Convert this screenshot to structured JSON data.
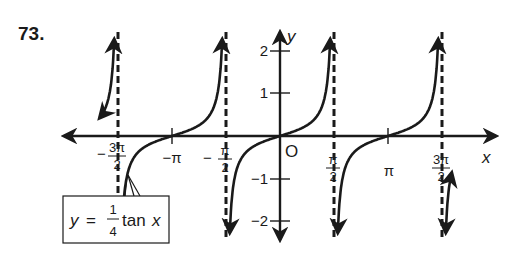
{
  "problem_number": "73.",
  "colors": {
    "ink": "#1a1a1a",
    "background": "#ffffff"
  },
  "axes": {
    "x_label": "x",
    "y_label": "y",
    "origin_label": "O",
    "x_ticks": [
      {
        "sign": "−",
        "num": "3π",
        "den": "2",
        "value": -4.712
      },
      {
        "label": "−π",
        "value": -3.1416
      },
      {
        "sign": "−",
        "num": "π",
        "den": "2",
        "value": -1.5708
      },
      {
        "num": "π",
        "den": "2",
        "value": 1.5708
      },
      {
        "label": "π",
        "value": 3.1416
      },
      {
        "num": "3π",
        "den": "2",
        "value": 4.712
      }
    ],
    "y_ticks": [
      "2",
      "1",
      "−1",
      "−2"
    ]
  },
  "equation": {
    "lhs": "y",
    "equals": "=",
    "coef_num": "1",
    "coef_den": "4",
    "func": "tan",
    "var": "x"
  },
  "chart_data": {
    "type": "line",
    "title": "",
    "function": "y = (1/4) tan x",
    "xlabel": "x",
    "ylabel": "y",
    "xlim": [
      -5.5,
      7.6
    ],
    "ylim": [
      -2.3,
      2.3
    ],
    "grid": false,
    "asymptotes": [
      "-3π/2",
      "-π/2",
      "π/2",
      "3π/2"
    ],
    "x_tick_labels": [
      "-3π/2",
      "-π",
      "-π/2",
      "π/2",
      "π",
      "3π/2"
    ],
    "y_tick_labels": [
      "-2",
      "-1",
      "1",
      "2"
    ],
    "zeros": [
      "-π",
      "0",
      "π"
    ],
    "annotation": "y = 1/4 tan x",
    "series": [
      {
        "name": "y = 1/4 tan x",
        "x": [
          -1.2,
          -1.4,
          -1.5,
          -1.55
        ],
        "y": [
          0.643,
          1.449,
          3.52,
          12.75
        ]
      }
    ]
  }
}
